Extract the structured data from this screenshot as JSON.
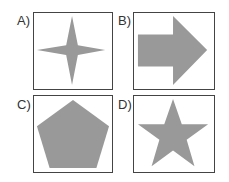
{
  "options": [
    {
      "label": "A)",
      "shape": "four-pointed-star"
    },
    {
      "label": "B)",
      "shape": "right-arrow"
    },
    {
      "label": "C)",
      "shape": "pentagon"
    },
    {
      "label": "D)",
      "shape": "five-pointed-star"
    }
  ],
  "colors": {
    "fill": "#999999",
    "border": "#444444"
  }
}
